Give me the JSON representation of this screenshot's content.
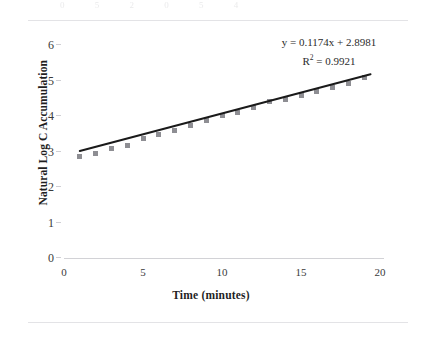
{
  "page": {
    "ghost_text_top": "0 5 2 0 5 4",
    "rule_color": "#e3e3e6"
  },
  "annotation": {
    "equation": "y = 0.1174x + 2.8981",
    "r_squared_prefix": "R",
    "r_squared_exponent": "2",
    "r_squared_value": "= 0.9921"
  },
  "chart_data": {
    "type": "scatter",
    "title": "",
    "xlabel": "Time (minutes)",
    "ylabel": "Natural Log C Accumulation",
    "xlim": [
      0,
      20
    ],
    "ylim": [
      0,
      6
    ],
    "xticks": [
      0,
      5,
      10,
      15,
      20
    ],
    "yticks": [
      0,
      1,
      2,
      3,
      4,
      5,
      6
    ],
    "grid": false,
    "legend": null,
    "marker_color": "#8e8e93",
    "line_color": "#1a1a1a",
    "series": [
      {
        "name": "Natural Log C Accumulation",
        "x": [
          1,
          2,
          3,
          4,
          5,
          6,
          7,
          8,
          9,
          10,
          11,
          12,
          13,
          14,
          15,
          16,
          17,
          18,
          19
        ],
        "y": [
          2.85,
          2.95,
          3.09,
          3.17,
          3.36,
          3.47,
          3.59,
          3.72,
          3.86,
          4.02,
          4.11,
          4.24,
          4.42,
          4.47,
          4.57,
          4.69,
          4.79,
          4.92,
          5.08
        ]
      }
    ],
    "trendline": {
      "type": "linear",
      "slope": 0.1174,
      "intercept": 2.8981,
      "r_squared": 0.9921,
      "x_start": 1,
      "x_end": 19.4,
      "equation_label": "y = 0.1174x + 2.8981",
      "r2_label": "R² = 0.9921"
    }
  }
}
